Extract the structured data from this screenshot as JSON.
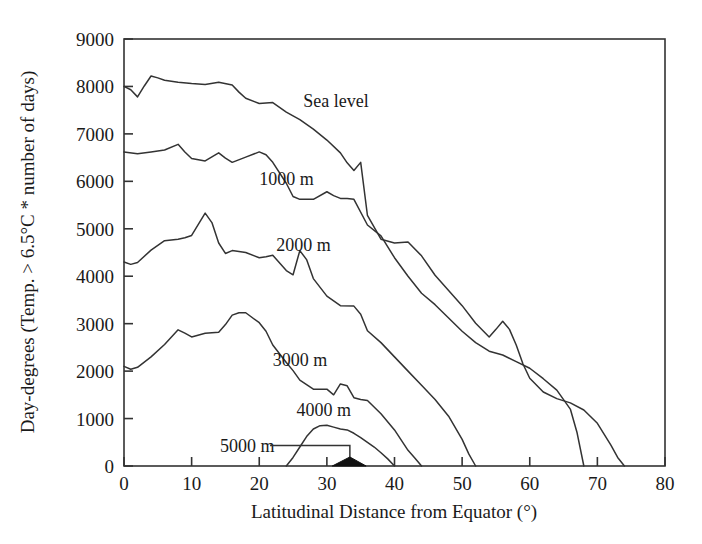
{
  "chart_data": {
    "type": "line",
    "title": "",
    "xlabel": "Latitudinal Distance from Equator (°)",
    "ylabel": "Day-degrees (Temp. > 6.5°C * number of days)",
    "xlim": [
      0,
      80
    ],
    "ylim": [
      0,
      9000
    ],
    "xticks": [
      0,
      10,
      20,
      30,
      40,
      50,
      60,
      70,
      80
    ],
    "yticks": [
      0,
      1000,
      2000,
      3000,
      4000,
      5000,
      6000,
      7000,
      8000,
      9000
    ],
    "xtick_labels": [
      "0",
      "10",
      "20",
      "30",
      "40",
      "50",
      "60",
      "70",
      "80"
    ],
    "ytick_labels": [
      "0",
      "1000",
      "2000",
      "3000",
      "4000",
      "5000",
      "6000",
      "7000",
      "8000",
      "9000"
    ],
    "grid": false,
    "legend": "inline-labels",
    "series": [
      {
        "name": "Sea level",
        "label": "Sea level",
        "label_x": 26.5,
        "label_y": 7700,
        "x": [
          0,
          1,
          2,
          3,
          4,
          5,
          6,
          8,
          10,
          12,
          14,
          16,
          17,
          18,
          20,
          22,
          24,
          25,
          26,
          28,
          30,
          32,
          33,
          34,
          35,
          36,
          38,
          40,
          42,
          44,
          46,
          48,
          50,
          52,
          54,
          55,
          56,
          57,
          58,
          59,
          60,
          62,
          64,
          66,
          68,
          70,
          72,
          73,
          74
        ],
        "y": [
          8000,
          7930,
          7780,
          8010,
          8220,
          8180,
          8130,
          8090,
          8060,
          8040,
          8090,
          8030,
          7880,
          7750,
          7640,
          7660,
          7460,
          7380,
          7300,
          7100,
          6870,
          6600,
          6390,
          6230,
          6400,
          5280,
          4780,
          4700,
          4720,
          4430,
          4020,
          3700,
          3380,
          3010,
          2720,
          2880,
          3050,
          2880,
          2550,
          2150,
          1850,
          1560,
          1420,
          1330,
          1180,
          900,
          440,
          180,
          0
        ]
      },
      {
        "name": "1000 m",
        "label": "1000 m",
        "label_x": 20.0,
        "label_y": 6050,
        "x": [
          0,
          2,
          4,
          6,
          8,
          9,
          10,
          12,
          14,
          15,
          16,
          18,
          20,
          21,
          22,
          24,
          25,
          26,
          28,
          30,
          31,
          32,
          33,
          34,
          36,
          38,
          40,
          42,
          44,
          46,
          48,
          50,
          52,
          54,
          56,
          58,
          60,
          62,
          64,
          66,
          67,
          68
        ],
        "y": [
          6620,
          6580,
          6620,
          6660,
          6780,
          6620,
          6480,
          6430,
          6600,
          6490,
          6400,
          6510,
          6620,
          6560,
          6400,
          5960,
          5680,
          5620,
          5620,
          5780,
          5700,
          5640,
          5640,
          5620,
          5080,
          4850,
          4390,
          4000,
          3640,
          3400,
          3120,
          2840,
          2600,
          2420,
          2340,
          2200,
          2060,
          1840,
          1600,
          1200,
          700,
          0
        ]
      },
      {
        "name": "2000 m",
        "label": "2000 m",
        "label_x": 22.5,
        "label_y": 4660,
        "x": [
          0,
          1,
          2,
          4,
          6,
          8,
          9,
          10,
          12,
          13,
          14,
          15,
          16,
          18,
          20,
          21,
          22,
          24,
          25,
          26,
          27,
          28,
          30,
          32,
          34,
          35,
          36,
          38,
          40,
          42,
          44,
          46,
          48,
          50,
          51,
          52
        ],
        "y": [
          4300,
          4250,
          4290,
          4550,
          4750,
          4780,
          4810,
          4860,
          5330,
          5130,
          4700,
          4480,
          4540,
          4500,
          4390,
          4410,
          4440,
          4120,
          4030,
          4540,
          4350,
          3950,
          3580,
          3380,
          3370,
          3200,
          2850,
          2600,
          2300,
          2000,
          1700,
          1400,
          1050,
          560,
          250,
          0
        ]
      },
      {
        "name": "3000 m",
        "label": "3000 m",
        "label_x": 22.0,
        "label_y": 2230,
        "x": [
          0,
          1,
          2,
          4,
          6,
          8,
          9,
          10,
          12,
          14,
          15,
          16,
          17,
          18,
          20,
          21,
          22,
          24,
          25,
          26,
          28,
          30,
          31,
          32,
          33,
          34,
          35,
          36,
          38,
          40,
          42,
          43,
          44
        ],
        "y": [
          2100,
          2040,
          2080,
          2300,
          2560,
          2870,
          2800,
          2720,
          2800,
          2820,
          2980,
          3180,
          3230,
          3230,
          3020,
          2840,
          2550,
          2180,
          2010,
          1810,
          1620,
          1620,
          1500,
          1730,
          1690,
          1440,
          1400,
          1380,
          1100,
          760,
          330,
          170,
          0
        ]
      },
      {
        "name": "4000 m",
        "label": "4000 m",
        "label_x": 25.5,
        "label_y": 1180,
        "x": [
          24,
          25,
          26,
          27,
          28,
          29,
          30,
          31,
          32,
          33,
          34,
          35,
          36,
          37,
          38,
          39,
          40
        ],
        "y": [
          0,
          180,
          400,
          620,
          780,
          850,
          860,
          820,
          780,
          760,
          690,
          600,
          500,
          400,
          280,
          150,
          0
        ]
      }
    ],
    "annotations": [
      {
        "name": "5000 m",
        "label": "5000 m",
        "label_x": 14.2,
        "label_y": 430,
        "leader_from_x": 21.6,
        "leader_to_x": 33.4,
        "leader_y": 430,
        "drop_to_y": 0,
        "marker_x": [
          30.8,
          33.4,
          35.8
        ],
        "marker_y": [
          0,
          190,
          0
        ]
      }
    ]
  },
  "figure": {
    "background_color": "#ffffff",
    "line_color": "#333333",
    "text_color": "#1a1a1a"
  }
}
